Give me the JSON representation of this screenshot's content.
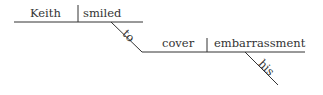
{
  "diagram": {
    "type": "sentence-diagram",
    "sentence_words": {
      "subject": "Keith",
      "verb": "smiled",
      "infinitive_marker": "to",
      "infinitive_verb": "cover",
      "object": "embarrassment",
      "modifier": "his"
    },
    "colors": {
      "line": "#333333",
      "text": "#333333"
    }
  }
}
